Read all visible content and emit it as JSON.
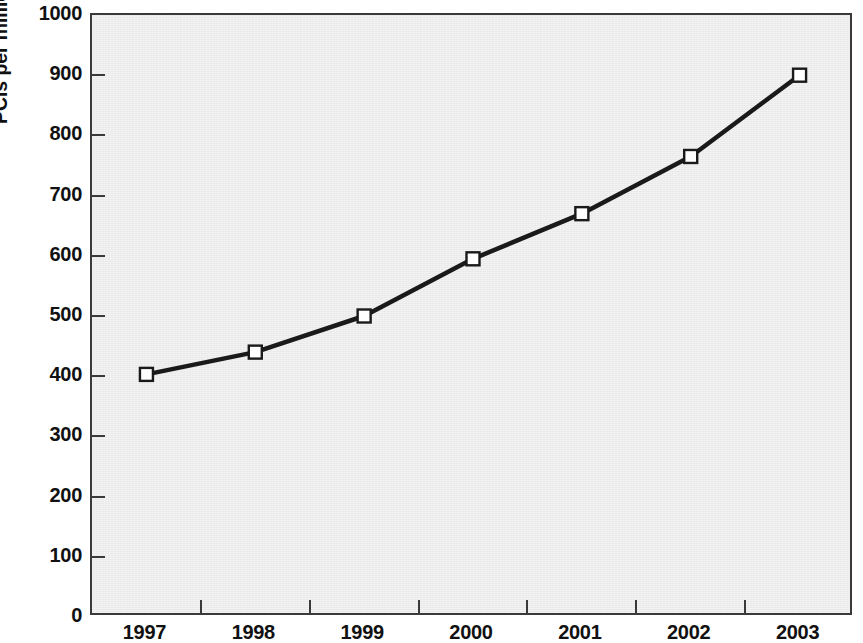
{
  "chart_data": {
    "type": "line",
    "title": "",
    "subtitle": "",
    "xlabel": "",
    "ylabel": "PCIs per million population",
    "categories": [
      "1997",
      "1998",
      "1999",
      "2000",
      "2001",
      "2002",
      "2003"
    ],
    "values": [
      403,
      440,
      500,
      595,
      670,
      765,
      900
    ],
    "series": [
      {
        "name": "PCIs per million population",
        "values": [
          403,
          440,
          500,
          595,
          670,
          765,
          900
        ]
      }
    ],
    "ylim": [
      0,
      1000
    ],
    "y_ticks": [
      0,
      100,
      200,
      300,
      400,
      500,
      600,
      700,
      800,
      900,
      1000
    ],
    "y_tick_labels": [
      "0",
      "100",
      "200",
      "300",
      "400",
      "500",
      "600",
      "700",
      "800",
      "900",
      "1000"
    ],
    "x_tick_labels": [
      "1997",
      "1998",
      "1999",
      "2000",
      "2001",
      "2002",
      "2003"
    ],
    "grid": false,
    "legend": "none",
    "marker": "open-square",
    "line_color": "#1a1a1a",
    "marker_face_color": "#ffffff",
    "marker_edge_color": "#1a1a1a",
    "plot_background_color": "#ededed",
    "axis_color": "#3a3a3a",
    "text_color": "#111111",
    "annotations": []
  }
}
